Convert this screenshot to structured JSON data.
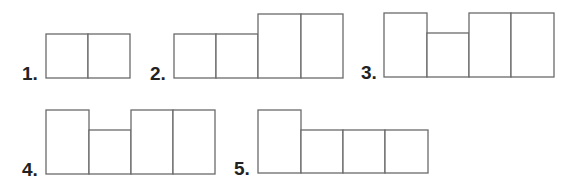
{
  "figures": [
    {
      "label": "1.",
      "label_pos": [
        22,
        64
      ],
      "boxes": [
        {
          "x": 46,
          "y": 34,
          "w": 42,
          "h": 44
        },
        {
          "x": 88,
          "y": 34,
          "w": 42,
          "h": 44
        }
      ]
    },
    {
      "label": "2.",
      "label_pos": [
        150,
        64
      ],
      "boxes": [
        {
          "x": 174,
          "y": 34,
          "w": 42,
          "h": 44
        },
        {
          "x": 216,
          "y": 34,
          "w": 42,
          "h": 44
        },
        {
          "x": 258,
          "y": 14,
          "w": 43,
          "h": 64
        },
        {
          "x": 301,
          "y": 14,
          "w": 42,
          "h": 64
        }
      ]
    },
    {
      "label": "3.",
      "label_pos": [
        361,
        63
      ],
      "boxes": [
        {
          "x": 384,
          "y": 13,
          "w": 43,
          "h": 64
        },
        {
          "x": 427,
          "y": 33,
          "w": 42,
          "h": 44
        },
        {
          "x": 469,
          "y": 13,
          "w": 42,
          "h": 64
        },
        {
          "x": 511,
          "y": 13,
          "w": 43,
          "h": 64
        }
      ]
    },
    {
      "label": "4.",
      "label_pos": [
        22,
        160
      ],
      "boxes": [
        {
          "x": 46,
          "y": 110,
          "w": 43,
          "h": 64
        },
        {
          "x": 89,
          "y": 130,
          "w": 42,
          "h": 44
        },
        {
          "x": 131,
          "y": 110,
          "w": 42,
          "h": 64
        },
        {
          "x": 173,
          "y": 110,
          "w": 42,
          "h": 64
        }
      ]
    },
    {
      "label": "5.",
      "label_pos": [
        234,
        159
      ],
      "boxes": [
        {
          "x": 258,
          "y": 110,
          "w": 43,
          "h": 63
        },
        {
          "x": 301,
          "y": 130,
          "w": 42,
          "h": 43
        },
        {
          "x": 343,
          "y": 130,
          "w": 42,
          "h": 43
        },
        {
          "x": 385,
          "y": 130,
          "w": 43,
          "h": 43
        }
      ]
    }
  ]
}
